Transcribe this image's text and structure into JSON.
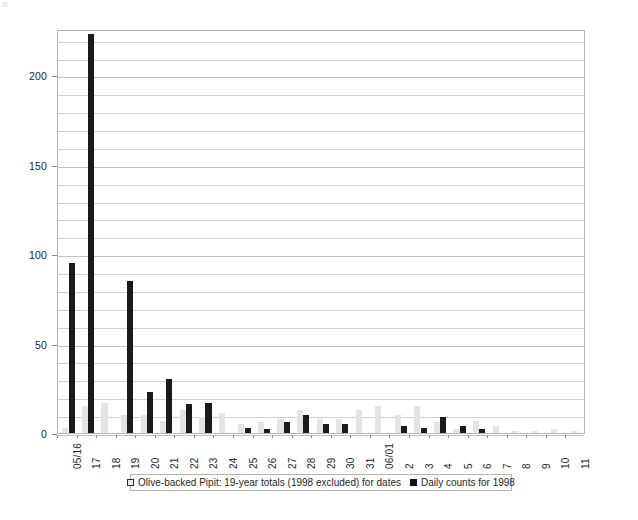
{
  "chart_data": {
    "type": "bar",
    "title": "",
    "subtitle": "",
    "xlabel": "",
    "ylabel": "",
    "ylim": [
      0,
      226
    ],
    "yticks": [
      0,
      50,
      100,
      150,
      200
    ],
    "ytick_labels": [
      "0",
      "50",
      "100",
      "150",
      "200"
    ],
    "gridline_interval": 10,
    "grid": true,
    "legend_position": "bottom",
    "categories": [
      "05/16",
      "17",
      "18",
      "19",
      "20",
      "21",
      "22",
      "23",
      "24",
      "25",
      "26",
      "27",
      "28",
      "29",
      "30",
      "31",
      "06/01",
      "2",
      "3",
      "4",
      "5",
      "6",
      "7",
      "8",
      "9",
      "10",
      "11"
    ],
    "series": [
      {
        "name": "Olive-backed Pipit: 19-year totals (1998 excluded) for dates",
        "color": "#e4e4e4",
        "values": [
          3,
          15,
          17,
          10,
          10,
          7,
          13,
          9,
          11,
          5,
          6,
          8,
          13,
          8,
          8,
          13,
          15,
          10,
          15,
          6,
          2,
          7,
          4,
          1,
          1,
          2,
          1
        ]
      },
      {
        "name": "Daily counts for 1998",
        "color": "#1a1a1a",
        "values": [
          95,
          223,
          0,
          85,
          23,
          30,
          16,
          17,
          0,
          3,
          2,
          6,
          10,
          5,
          5,
          0,
          0,
          4,
          3,
          9,
          4,
          2,
          0,
          0,
          0,
          0,
          0
        ]
      }
    ]
  },
  "legend": {
    "entries": [
      {
        "label": "Olive-backed Pipit: 19-year totals (1998 excluded) for dates",
        "swatch": "open-square-swatch"
      },
      {
        "label": "Daily counts for 1998",
        "swatch": "filled-square-swatch"
      }
    ]
  }
}
